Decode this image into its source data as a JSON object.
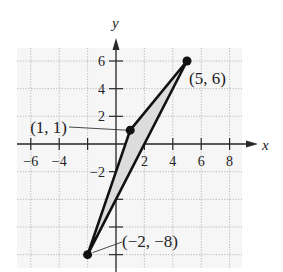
{
  "chart_data": {
    "type": "scatter",
    "title": "",
    "xlabel": "x",
    "ylabel": "y",
    "xlim": [
      -7,
      9
    ],
    "ylim": [
      -9,
      7
    ],
    "grid": true,
    "x_ticks": [
      -6,
      -4,
      -2,
      2,
      4,
      6,
      8
    ],
    "y_ticks": [
      6,
      4,
      2,
      -2,
      -4,
      -6,
      -8
    ],
    "x_tick_labels": [
      "−6",
      "−4",
      "",
      "2",
      "4",
      "6",
      "8"
    ],
    "y_tick_labels": [
      "6",
      "4",
      "2",
      "−2",
      "",
      "",
      ""
    ],
    "series": [
      {
        "name": "triangle",
        "shape": "polygon",
        "shaded": true,
        "points": [
          {
            "x": 1,
            "y": 1,
            "label": "(1, 1)"
          },
          {
            "x": 5,
            "y": 6,
            "label": "(5, 6)"
          },
          {
            "x": -2,
            "y": -8,
            "label": "(−2, −8)"
          }
        ]
      }
    ]
  },
  "colors": {
    "grid": "#a8a8a8",
    "axis": "#2a2a2a",
    "polygon_stroke": "#111111",
    "polygon_fill": "#dcdcdc",
    "plot_bg": "#f6f6f6"
  }
}
